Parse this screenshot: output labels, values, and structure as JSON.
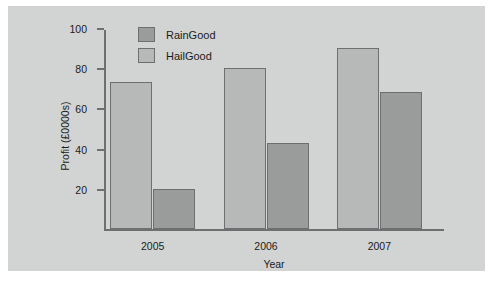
{
  "chart_data": {
    "type": "bar",
    "title": "",
    "xlabel": "Year",
    "ylabel": "Profit (£0000s)",
    "categories": [
      "2005",
      "2006",
      "2007"
    ],
    "series": [
      {
        "name": "RainGood",
        "color": "#9a9c9b",
        "values": [
          20,
          43,
          68
        ]
      },
      {
        "name": "HailGood",
        "color": "#b7b9b8",
        "values": [
          73,
          80,
          90
        ]
      }
    ],
    "draw_order": [
      "HailGood",
      "RainGood"
    ],
    "ylim": [
      0,
      100
    ],
    "yticks": [
      20,
      40,
      60,
      80,
      100
    ],
    "grid": false,
    "legend_position": "top-left-inside",
    "background_color": "#d2d4d3",
    "axis_color": "#6e6f70"
  },
  "legend": {
    "entries": [
      {
        "label": "RainGood",
        "swatch": "s-raingood"
      },
      {
        "label": "HailGood",
        "swatch": "s-hailgood"
      }
    ]
  }
}
